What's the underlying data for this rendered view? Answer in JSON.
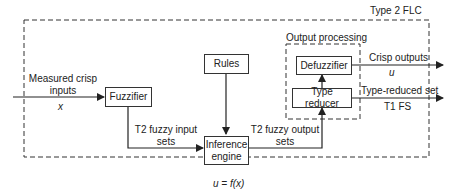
{
  "diagram": {
    "title": "Type 2 FLC",
    "output_group_label": "Output processing",
    "blocks": {
      "fuzzifier": "Fuzzifier",
      "rules": "Rules",
      "inference": "Inference engine",
      "defuzzifier": "Defuzzifier",
      "type_reducer": "Type reducer"
    },
    "labels": {
      "input": "Measured crisp inputs",
      "input_var": "x",
      "t2_input": "T2 fuzzy input sets",
      "t2_output": "T2 fuzzy output sets",
      "crisp_out": "Crisp outputs",
      "crisp_var": "u",
      "type_reduced": "Type-reduced set",
      "t1fs": "T1 FS",
      "function": "u = f(x)"
    },
    "colors": {
      "line": "#333333",
      "background": "#ffffff"
    }
  }
}
